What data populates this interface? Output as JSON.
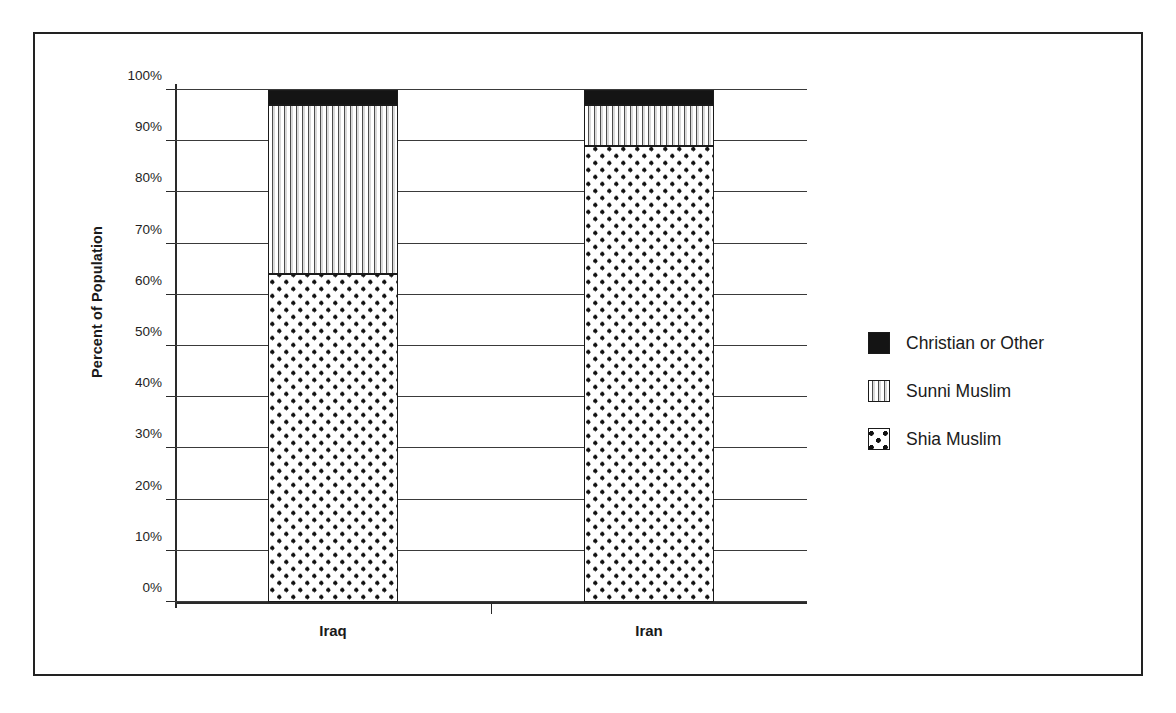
{
  "chart_data": {
    "type": "bar",
    "subtype": "stacked-100-percent",
    "title": "",
    "xlabel": "",
    "ylabel": "Percent of Population",
    "categories": [
      "Iraq",
      "Iran"
    ],
    "series": [
      {
        "name": "Shia Muslim",
        "values": [
          64,
          89
        ]
      },
      {
        "name": "Sunni Muslim",
        "values": [
          33,
          8
        ]
      },
      {
        "name": "Christian or Other",
        "values": [
          3,
          3
        ]
      }
    ],
    "ylim": [
      0,
      100
    ],
    "ytick_labels": [
      "0%",
      "10%",
      "20%",
      "30%",
      "40%",
      "50%",
      "60%",
      "70%",
      "80%",
      "90%",
      "100%"
    ],
    "ytick_values": [
      0,
      10,
      20,
      30,
      40,
      50,
      60,
      70,
      80,
      90,
      100
    ],
    "grid": true,
    "legend_position": "right",
    "legend_order": [
      "Christian or Other",
      "Sunni Muslim",
      "Shia Muslim"
    ],
    "colors": {
      "Shia Muslim": "#ffffff",
      "Sunni Muslim": "#ffffff",
      "Christian or Other": "#141414",
      "axis": "#2a2a2a",
      "frame": "#222222",
      "text": "#1a1a1a"
    },
    "patterns": {
      "Shia Muslim": "dots",
      "Sunni Muslim": "vertical-stripes",
      "Christian or Other": "solid"
    }
  },
  "legend": {
    "items": [
      {
        "label": "Christian or Other",
        "pattern": "solid"
      },
      {
        "label": "Sunni Muslim",
        "pattern": "vertical-stripes"
      },
      {
        "label": "Shia Muslim",
        "pattern": "dots"
      }
    ]
  }
}
